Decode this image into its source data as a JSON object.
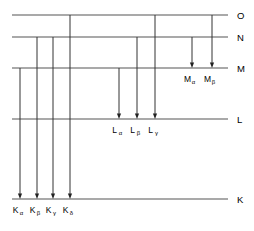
{
  "diagram": {
    "type": "energy-level-diagram",
    "geometry": {
      "width": 254,
      "height": 231,
      "line_left_x": 12,
      "line_right_x": 228,
      "label_x": 237
    },
    "colors": {
      "level_line": "#555555",
      "transition_line": "#333333",
      "arrow_head": "#222222",
      "text": "#000000",
      "background": "#ffffff"
    },
    "levels": [
      {
        "id": "O",
        "label": "O",
        "y": 15
      },
      {
        "id": "N",
        "label": "N",
        "y": 37
      },
      {
        "id": "M",
        "label": "M",
        "y": 68
      },
      {
        "id": "L",
        "label": "L",
        "y": 119
      },
      {
        "id": "K",
        "label": "K",
        "y": 199
      }
    ],
    "transitions": [
      {
        "id": "K-alpha",
        "base": "K",
        "sub": "α",
        "x": 20,
        "from_y": 68,
        "to_y": 199,
        "label_y": 213,
        "group": "K"
      },
      {
        "id": "K-beta",
        "base": "K",
        "sub": "β",
        "x": 37,
        "from_y": 37,
        "to_y": 199,
        "label_y": 213,
        "group": "K"
      },
      {
        "id": "K-gamma",
        "base": "K",
        "sub": "γ",
        "x": 53,
        "from_y": 37,
        "to_y": 199,
        "label_y": 213,
        "group": "K"
      },
      {
        "id": "K-delta",
        "base": "K",
        "sub": "δ",
        "x": 70,
        "from_y": 15,
        "to_y": 199,
        "label_y": 213,
        "group": "K"
      },
      {
        "id": "L-alpha",
        "base": "L",
        "sub": "α",
        "x": 119,
        "from_y": 68,
        "to_y": 119,
        "label_y": 133,
        "group": "L"
      },
      {
        "id": "L-beta",
        "base": "L",
        "sub": "β",
        "x": 137,
        "from_y": 37,
        "to_y": 119,
        "label_y": 133,
        "group": "L"
      },
      {
        "id": "L-gamma",
        "base": "L",
        "sub": "γ",
        "x": 155,
        "from_y": 15,
        "to_y": 119,
        "label_y": 133,
        "group": "L"
      },
      {
        "id": "M-alpha",
        "base": "M",
        "sub": "α",
        "x": 192,
        "from_y": 37,
        "to_y": 68,
        "label_y": 82,
        "group": "M"
      },
      {
        "id": "M-beta",
        "base": "M",
        "sub": "β",
        "x": 212,
        "from_y": 15,
        "to_y": 68,
        "label_y": 82,
        "group": "M"
      }
    ]
  }
}
